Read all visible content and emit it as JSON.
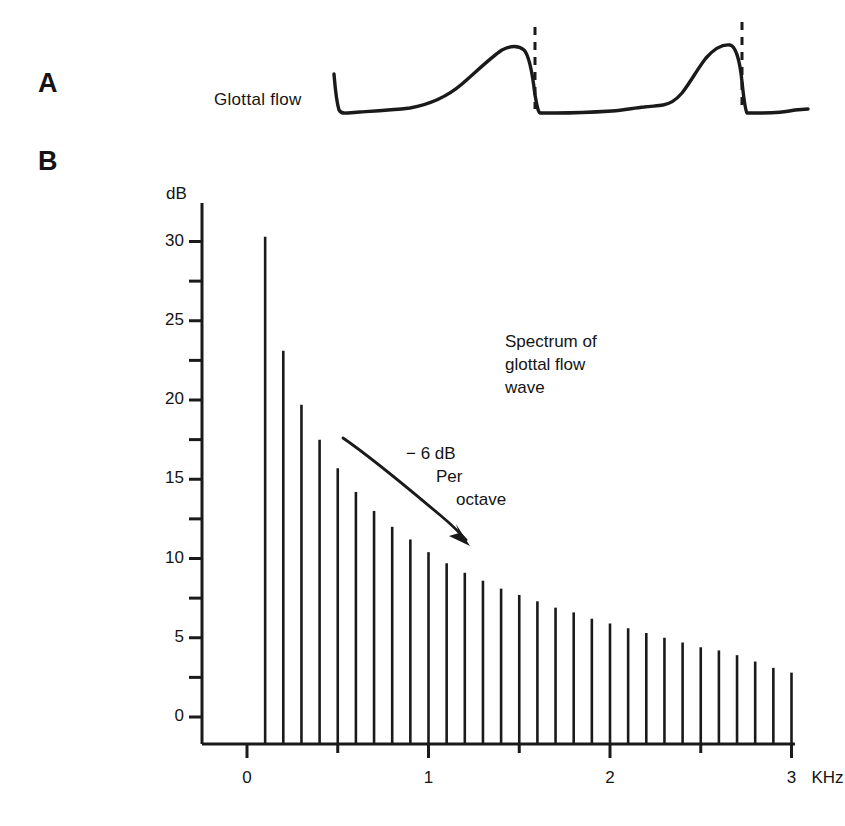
{
  "figure": {
    "background_color": "#ffffff",
    "ink_color": "#1a1a1a",
    "width": 845,
    "height": 826
  },
  "panel_a": {
    "letter": "A",
    "label": "Glottal flow",
    "description": "Two cycles of a glottal flow waveform with dashed vertical lines at glottal closure instants",
    "dashed_line_count": 2
  },
  "panel_b": {
    "letter": "B",
    "caption_line_1": "Spectrum of",
    "caption_line_2": "glottal flow",
    "caption_line_3": "wave",
    "annotation_line_1": "− 6 dB",
    "annotation_line_2": "Per",
    "annotation_line_3": "octave",
    "x_units": "KHz"
  },
  "chart_data": {
    "type": "bar",
    "xlabel": "KHz",
    "ylabel": "dB",
    "xlim": [
      -0.1,
      3.05
    ],
    "ylim": [
      -1.7,
      32.5
    ],
    "grid": false,
    "legend": null,
    "x_ticks": [
      0,
      1,
      2,
      3
    ],
    "x_tick_labels": [
      "0",
      "1",
      "2",
      "3"
    ],
    "x_minor_ticks": [
      0.5,
      1.5,
      2.5
    ],
    "y_ticks": [
      0,
      5,
      10,
      15,
      20,
      25,
      30
    ],
    "y_tick_labels": [
      "0",
      "5",
      "10",
      "15",
      "20",
      "25",
      "30"
    ],
    "y_minor_ticks": [
      2.5,
      7.5,
      12.5,
      17.5,
      22.5,
      27.5
    ],
    "x": [
      0.1,
      0.2,
      0.3,
      0.4,
      0.5,
      0.6,
      0.7,
      0.8,
      0.9,
      1.0,
      1.1,
      1.2,
      1.3,
      1.4,
      1.5,
      1.6,
      1.7,
      1.8,
      1.9,
      2.0,
      2.1,
      2.2,
      2.3,
      2.4,
      2.5,
      2.6,
      2.7,
      2.8,
      2.9,
      3.0
    ],
    "values": [
      30.3,
      23.1,
      19.7,
      17.5,
      15.7,
      14.2,
      13.0,
      12.0,
      11.2,
      10.4,
      9.7,
      9.1,
      8.6,
      8.1,
      7.7,
      7.3,
      6.9,
      6.6,
      6.2,
      5.9,
      5.6,
      5.3,
      5.0,
      4.7,
      4.4,
      4.2,
      3.9,
      3.5,
      3.1,
      2.8
    ],
    "annotations": [
      {
        "text": "Spectrum of glottal flow wave",
        "x": 1.45,
        "y": 25.0
      },
      {
        "text": "− 6 dB Per octave",
        "x": 0.9,
        "y": 17.2
      },
      {
        "text": "arrow",
        "from": [
          0.53,
          18.5
        ],
        "to": [
          1.22,
          11.5
        ]
      }
    ]
  }
}
